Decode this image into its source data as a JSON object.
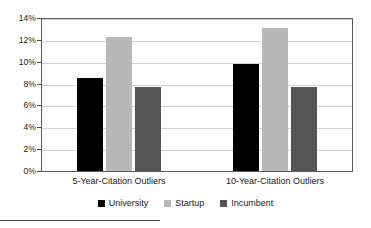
{
  "chart_data": {
    "type": "bar",
    "title": "",
    "xlabel": "",
    "ylabel": "",
    "categories": [
      "5-Year-Citation Outliers",
      "10-Year-Citation Outliers"
    ],
    "series": [
      {
        "name": "University",
        "color": "#000000",
        "values": [
          8.5,
          9.8
        ]
      },
      {
        "name": "Startup",
        "color": "#b8b8b8",
        "values": [
          12.3,
          13.1
        ]
      },
      {
        "name": "Incumbent",
        "color": "#545454",
        "values": [
          7.7,
          7.7
        ]
      }
    ],
    "ylim": [
      0,
      14
    ],
    "y_ticks": [
      "0%",
      "2%",
      "4%",
      "6%",
      "8%",
      "10%",
      "12%",
      "14%"
    ],
    "y_tick_values": [
      0,
      2,
      4,
      6,
      8,
      10,
      12,
      14
    ],
    "grid": true,
    "legend_position": "bottom"
  }
}
